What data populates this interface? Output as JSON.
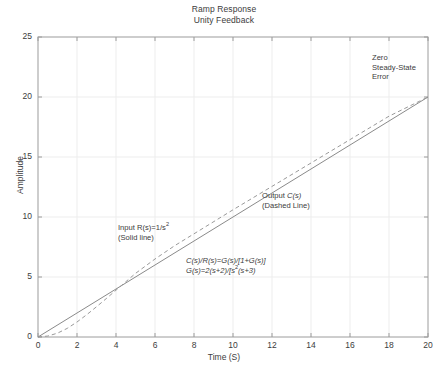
{
  "chart_data": {
    "type": "line",
    "title": "Ramp Response",
    "subtitle": "Unity Feedback",
    "xlabel": "Time (S)",
    "ylabel": "Amplitude",
    "xlim": [
      0,
      20
    ],
    "ylim": [
      0,
      25
    ],
    "xticks": [
      0,
      2,
      4,
      6,
      8,
      10,
      12,
      14,
      16,
      18,
      20
    ],
    "yticks": [
      0,
      5,
      10,
      15,
      20,
      25
    ],
    "grid": true,
    "legend_position": "inline-annotations",
    "series": [
      {
        "name": "Input R(s)=1/s^2",
        "style": "solid",
        "color": "#8a8a8a",
        "x": [
          0,
          2,
          4,
          6,
          8,
          10,
          12,
          14,
          16,
          18,
          20
        ],
        "values": [
          0,
          2,
          4,
          6,
          8,
          10,
          12,
          14,
          16,
          18,
          20
        ]
      },
      {
        "name": "Output C(s)",
        "style": "dashed",
        "color": "#9a9a9a",
        "x": [
          0,
          0.5,
          1,
          1.5,
          2,
          2.5,
          3,
          3.5,
          4,
          4.5,
          5,
          6,
          7,
          8,
          10,
          12,
          14,
          16,
          18,
          20
        ],
        "values": [
          0,
          0.08,
          0.32,
          0.72,
          1.25,
          1.86,
          2.52,
          3.2,
          3.9,
          4.6,
          5.3,
          6.5,
          7.6,
          8.6,
          10.6,
          12.55,
          14.5,
          16.45,
          18.4,
          20.0
        ]
      }
    ],
    "annotations": [
      {
        "name": "zero-steady-state-error",
        "lines": [
          "Zero",
          "Steady-State",
          "Error"
        ],
        "x_px": 372,
        "y_px": 55
      },
      {
        "name": "output-label",
        "lines": [
          "Output C(s)",
          "(Dashed Line)"
        ],
        "x_px": 262,
        "y_px": 193
      },
      {
        "name": "input-label",
        "lines": [
          "Input R(s)=1/s²",
          "(Solid line)"
        ],
        "x_px": 118,
        "y_px": 225
      },
      {
        "name": "transfer-function",
        "lines": [
          "C(s)/R(s)=G(s)/[1+G(s)]",
          "G(s)=2(s+2)/[s²(s+3)"
        ],
        "x_px": 186,
        "y_px": 258
      }
    ]
  },
  "plot": {
    "title_line1": "Ramp Response",
    "title_line2": "Unity Feedback",
    "y_axis_label": "Amplitude",
    "x_axis_label": "Time (S)",
    "y_tick_labels": [
      "25",
      "20",
      "15",
      "10",
      "5",
      "0"
    ],
    "x_tick_labels": [
      "0",
      "2",
      "4",
      "6",
      "8",
      "10",
      "12",
      "14",
      "16",
      "18",
      "20"
    ],
    "annotation_zero_l1": "Zero",
    "annotation_zero_l2": "Steady-State",
    "annotation_zero_l3": "Error",
    "annotation_output_l1_a": "Output ",
    "annotation_output_l1_b": "C(s)",
    "annotation_output_l2": "(Dashed Line)",
    "annotation_input_l1_a": "Input R(s)=1/s",
    "annotation_input_l1_sup": "2",
    "annotation_input_l2": "(Solid line)",
    "annotation_eq_l1": "C(s)/R(s)=G(s)/[1+G(s)]",
    "annotation_eq_l2_a": "G(s)=2(s+2)/[s",
    "annotation_eq_l2_sup": "2",
    "annotation_eq_l2_b": "(s+3)"
  },
  "colors": {
    "axis": "#9c9c9c",
    "grid": "#ededed",
    "input_line": "#8a8a8a",
    "output_line": "#9a9a9a",
    "text": "#3c3c3c",
    "background": "#ffffff"
  }
}
